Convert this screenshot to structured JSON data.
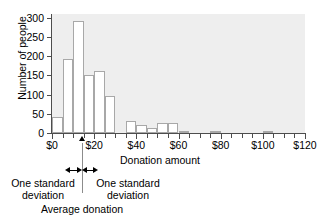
{
  "chart_data": {
    "type": "bar",
    "title": "",
    "xlabel": "Donation amount",
    "ylabel": "Number of people",
    "xlim": [
      0,
      120
    ],
    "ylim": [
      0,
      310
    ],
    "grid": false,
    "legend": null,
    "bin_width": 5,
    "x_tick_labels": [
      "$0",
      "$20",
      "$40",
      "$60",
      "$80",
      "$100",
      "$120"
    ],
    "x_tick_values": [
      0,
      20,
      40,
      60,
      80,
      100,
      120
    ],
    "y_tick_labels": [
      "0",
      "50",
      "100",
      "150",
      "200",
      "250",
      "300"
    ],
    "y_tick_values": [
      0,
      50,
      100,
      150,
      200,
      250,
      300
    ],
    "bins": [
      {
        "start": 0,
        "end": 5,
        "value": 42
      },
      {
        "start": 5,
        "end": 10,
        "value": 192
      },
      {
        "start": 10,
        "end": 15,
        "value": 292
      },
      {
        "start": 15,
        "end": 20,
        "value": 150
      },
      {
        "start": 20,
        "end": 25,
        "value": 162
      },
      {
        "start": 25,
        "end": 30,
        "value": 97
      },
      {
        "start": 30,
        "end": 35,
        "value": 0
      },
      {
        "start": 35,
        "end": 40,
        "value": 30
      },
      {
        "start": 40,
        "end": 45,
        "value": 20
      },
      {
        "start": 45,
        "end": 50,
        "value": 14
      },
      {
        "start": 50,
        "end": 55,
        "value": 26
      },
      {
        "start": 55,
        "end": 60,
        "value": 26
      },
      {
        "start": 60,
        "end": 65,
        "value": 3
      },
      {
        "start": 65,
        "end": 70,
        "value": 0
      },
      {
        "start": 70,
        "end": 75,
        "value": 0
      },
      {
        "start": 75,
        "end": 80,
        "value": 4
      },
      {
        "start": 80,
        "end": 85,
        "value": 0
      },
      {
        "start": 85,
        "end": 90,
        "value": 0
      },
      {
        "start": 90,
        "end": 95,
        "value": 0
      },
      {
        "start": 95,
        "end": 100,
        "value": 0
      },
      {
        "start": 100,
        "end": 105,
        "value": 6
      },
      {
        "start": 105,
        "end": 110,
        "value": 0
      },
      {
        "start": 110,
        "end": 115,
        "value": 0
      },
      {
        "start": 115,
        "end": 120,
        "value": 0
      }
    ],
    "annotations": {
      "mean_label": "Average donation",
      "mean_value": 14,
      "sd_left_label": "One standard\ndeviation",
      "sd_right_label": "One standard\ndeviation",
      "sd_left_line1": "One standard",
      "sd_left_line2": "deviation",
      "sd_right_line1": "One standard",
      "sd_right_line2": "deviation"
    },
    "colors": {
      "plot_background": "#eeeeee",
      "bar_fill": "#ffffff",
      "bar_edge": "#a8a8a8",
      "axis": "#4d4d4d",
      "text": "#000000",
      "annotation_line": "#8c8c8c"
    }
  }
}
